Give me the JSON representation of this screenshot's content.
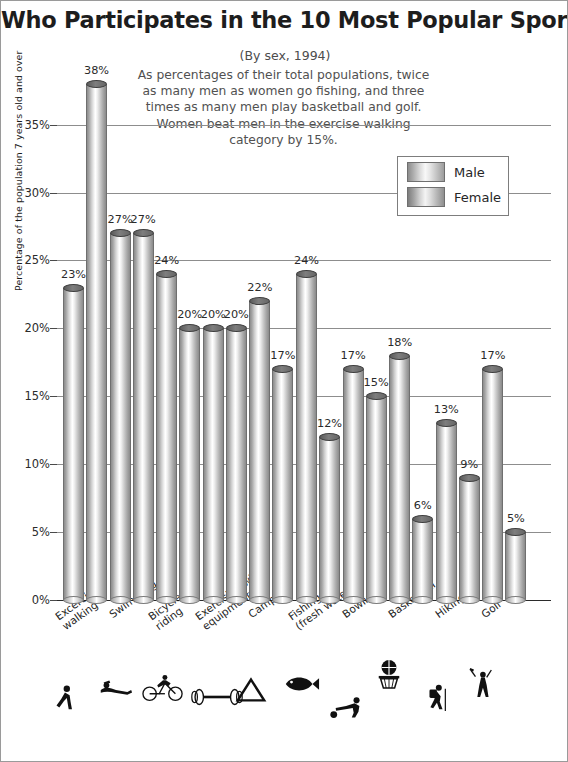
{
  "title": "Who Participates in the 10 Most Popular Sports?",
  "subtitle": "(By sex, 1994)",
  "blurb": "As percentages of their total populations, twice as many men as women go fishing, and three times as many men play basketball and golf.  Women beat men in the exercise walking category by 15%.",
  "yaxis_title": "Percentage of the population 7 years old and over",
  "legend": {
    "male_label": "Male",
    "female_label": "Female"
  },
  "chart_data": {
    "type": "bar",
    "title": "Who Participates in the 10 Most Popular Sports?",
    "subtitle": "(By sex, 1994)",
    "xlabel": "",
    "ylabel": "Percentage of the population 7 years old and over",
    "ylim": [
      0,
      38
    ],
    "yticks": [
      "0%",
      "5%",
      "10%",
      "15%",
      "20%",
      "25%",
      "30%",
      "35%"
    ],
    "ytick_values": [
      0,
      5,
      10,
      15,
      20,
      25,
      30,
      35
    ],
    "grid": true,
    "legend_position": "top-right",
    "categories": [
      "Excercise walking",
      "Swimming",
      "Bicycle riding",
      "Exercising with equipment",
      "Camping",
      "Fishing (fresh water)",
      "Bowling",
      "Basketball",
      "Hiking",
      "Golf"
    ],
    "category_lines": [
      [
        "Excercise",
        "walking"
      ],
      [
        "Swimming"
      ],
      [
        "Bicycle",
        "riding"
      ],
      [
        "Exercising with",
        "equipment"
      ],
      [
        "Camping"
      ],
      [
        "Fishing",
        "(fresh water)"
      ],
      [
        "Bowling"
      ],
      [
        "Basketball"
      ],
      [
        "Hiking"
      ],
      [
        "Golf"
      ]
    ],
    "category_icons": [
      "walking-icon",
      "swimming-icon",
      "bicycle-icon",
      "dumbbell-icon",
      "tent-icon",
      "fish-icon",
      "bowling-icon",
      "basketball-icon",
      "hiking-icon",
      "golf-icon"
    ],
    "series": [
      {
        "name": "Male",
        "values": [
          23,
          27,
          24,
          20,
          22,
          24,
          17,
          18,
          13,
          17
        ],
        "labels": [
          "23%",
          "27%",
          "24%",
          "20%",
          "22%",
          "24%",
          "17%",
          "18%",
          "13%",
          "17%"
        ]
      },
      {
        "name": "Female",
        "values": [
          38,
          27,
          20,
          20,
          17,
          12,
          15,
          6,
          9,
          5
        ],
        "labels": [
          "38%",
          "27%",
          "20%",
          "20%",
          "17%",
          "12%",
          "15%",
          "6%",
          "9%",
          "5%"
        ]
      }
    ]
  }
}
